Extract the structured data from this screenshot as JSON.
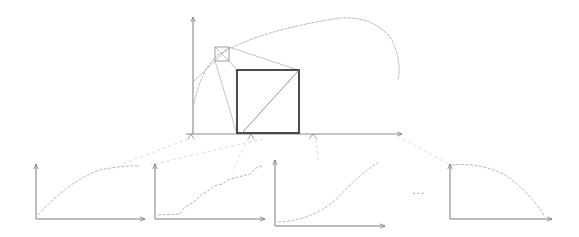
{
  "diagram": {
    "colors": {
      "axis": "#7a7a7a",
      "curve": "#b5b5b5",
      "box": "#3a3a3a",
      "connector": "#c8c8c8"
    },
    "main_plot": {
      "has_x_axis": true,
      "has_y_axis": true,
      "curve": "concave arc rising from y-axis to a peak then falling",
      "small_box": "small square with diagonals near upper-left of curve",
      "large_box": "bold square with one diagonal, magnified view of small box",
      "tick_marks": 4
    },
    "subplots": [
      {
        "name": "subplot-1",
        "shape": "concave increasing (saturating) curve"
      },
      {
        "name": "subplot-2",
        "shape": "noisy increasing step-like curve"
      },
      {
        "name": "subplot-3",
        "shape": "convex increasing curve"
      },
      {
        "name": "subplot-4",
        "shape": "concave decreasing curve"
      }
    ],
    "ellipsis": "..."
  }
}
